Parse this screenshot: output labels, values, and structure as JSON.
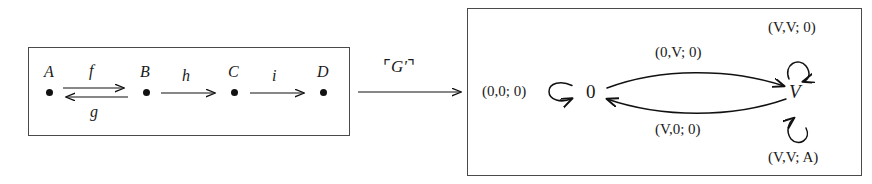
{
  "figure": {
    "left_panel": {
      "name": "source-category-box",
      "objects": [
        {
          "id": "A",
          "label": "A"
        },
        {
          "id": "B",
          "label": "B"
        },
        {
          "id": "C",
          "label": "C"
        },
        {
          "id": "D",
          "label": "D"
        }
      ],
      "morphisms": [
        {
          "id": "f",
          "label": "f",
          "from": "A",
          "to": "B",
          "direction": "right"
        },
        {
          "id": "g",
          "label": "g",
          "from": "B",
          "to": "A",
          "direction": "left"
        },
        {
          "id": "h",
          "label": "h",
          "from": "B",
          "to": "C",
          "direction": "right"
        },
        {
          "id": "i",
          "label": "i",
          "from": "C",
          "to": "D",
          "direction": "right"
        }
      ]
    },
    "middle_arrow": {
      "name": "functor-arrow",
      "label_open_quote": "⌜",
      "label_text": "G′",
      "label_close_quote": "⌝",
      "label_full": "⌜G′⌝"
    },
    "right_panel": {
      "name": "target-transition-system-box",
      "states": [
        {
          "id": "zero",
          "label": "0"
        },
        {
          "id": "V",
          "label": "V"
        }
      ],
      "transitions": [
        {
          "id": "loop-zero",
          "label": "(0,0; 0)",
          "from": "zero",
          "to": "zero",
          "kind": "self-loop",
          "position": "left"
        },
        {
          "id": "zero-to-V",
          "label": "(0,V; 0)",
          "from": "zero",
          "to": "V",
          "kind": "curve",
          "position": "top"
        },
        {
          "id": "V-to-zero",
          "label": "(V,0; 0)",
          "from": "V",
          "to": "zero",
          "kind": "curve",
          "position": "bottom"
        },
        {
          "id": "loop-V-top",
          "label": "(V,V; 0)",
          "from": "V",
          "to": "V",
          "kind": "self-loop",
          "position": "top"
        },
        {
          "id": "loop-V-bottom",
          "label": "(V,V; A)",
          "from": "V",
          "to": "V",
          "kind": "self-loop",
          "position": "bottom"
        }
      ]
    },
    "colors": {
      "ink": "#1a1a1a",
      "box_border": "#4a4a4a",
      "background": "#ffffff"
    }
  }
}
